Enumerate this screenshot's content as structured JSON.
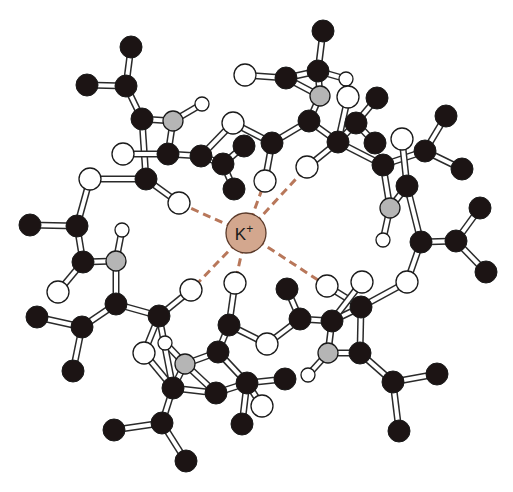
{
  "diagram": {
    "title": "",
    "ion": {
      "label": "K",
      "charge": "+",
      "x": 246,
      "y": 233,
      "r": 20,
      "fill": "#d3a78e",
      "stroke": "#5a3a2a"
    },
    "colors": {
      "carbon": "#1c1414",
      "oxygen": "#ffffff",
      "nitrogen": "#b5b5b5",
      "hydrogen": "#ffffff",
      "bond_fill": "#ffffff",
      "bond_stroke": "#2a2a2a",
      "coordination": "#b8775a"
    },
    "atoms": [
      {
        "id": "c1",
        "el": "C",
        "x": 131,
        "y": 47
      },
      {
        "id": "c2",
        "el": "C",
        "x": 126,
        "y": 86
      },
      {
        "id": "c3",
        "el": "C",
        "x": 87,
        "y": 85
      },
      {
        "id": "c4",
        "el": "C",
        "x": 142,
        "y": 119
      },
      {
        "id": "n1",
        "el": "N",
        "x": 173,
        "y": 121
      },
      {
        "id": "h1",
        "el": "H",
        "x": 202,
        "y": 104
      },
      {
        "id": "o1",
        "el": "O",
        "x": 123,
        "y": 154
      },
      {
        "id": "c5",
        "el": "C",
        "x": 168,
        "y": 154
      },
      {
        "id": "c6",
        "el": "C",
        "x": 201,
        "y": 156
      },
      {
        "id": "c7",
        "el": "C",
        "x": 244,
        "y": 146
      },
      {
        "id": "c8",
        "el": "C",
        "x": 223,
        "y": 164
      },
      {
        "id": "c9",
        "el": "C",
        "x": 234,
        "y": 189
      },
      {
        "id": "o2",
        "el": "O",
        "x": 233,
        "y": 123
      },
      {
        "id": "o3",
        "el": "O",
        "x": 90,
        "y": 179
      },
      {
        "id": "c10",
        "el": "C",
        "x": 146,
        "y": 179
      },
      {
        "id": "o4",
        "el": "O",
        "x": 179,
        "y": 203
      },
      {
        "id": "c11",
        "el": "C",
        "x": 77,
        "y": 226
      },
      {
        "id": "c12",
        "el": "C",
        "x": 30,
        "y": 225
      },
      {
        "id": "h2",
        "el": "H",
        "x": 122,
        "y": 230
      },
      {
        "id": "o5",
        "el": "O",
        "x": 245,
        "y": 75
      },
      {
        "id": "c13",
        "el": "C",
        "x": 323,
        "y": 31
      },
      {
        "id": "c14",
        "el": "C",
        "x": 318,
        "y": 71
      },
      {
        "id": "c15",
        "el": "C",
        "x": 286,
        "y": 78
      },
      {
        "id": "n2",
        "el": "N",
        "x": 320,
        "y": 96
      },
      {
        "id": "h3",
        "el": "H",
        "x": 346,
        "y": 79
      },
      {
        "id": "o6",
        "el": "O",
        "x": 348,
        "y": 97
      },
      {
        "id": "c16",
        "el": "C",
        "x": 309,
        "y": 121
      },
      {
        "id": "c17",
        "el": "C",
        "x": 272,
        "y": 143
      },
      {
        "id": "o7",
        "el": "O",
        "x": 265,
        "y": 181
      },
      {
        "id": "c18",
        "el": "C",
        "x": 377,
        "y": 98
      },
      {
        "id": "c19",
        "el": "C",
        "x": 356,
        "y": 123
      },
      {
        "id": "c20",
        "el": "C",
        "x": 375,
        "y": 143
      },
      {
        "id": "c21",
        "el": "C",
        "x": 338,
        "y": 142
      },
      {
        "id": "o8",
        "el": "O",
        "x": 307,
        "y": 167
      },
      {
        "id": "c22",
        "el": "C",
        "x": 383,
        "y": 165
      },
      {
        "id": "o9",
        "el": "O",
        "x": 402,
        "y": 139
      },
      {
        "id": "c23",
        "el": "C",
        "x": 425,
        "y": 151
      },
      {
        "id": "c24",
        "el": "C",
        "x": 446,
        "y": 116
      },
      {
        "id": "c25",
        "el": "C",
        "x": 462,
        "y": 169
      },
      {
        "id": "c26",
        "el": "C",
        "x": 407,
        "y": 186
      },
      {
        "id": "n3",
        "el": "N",
        "x": 390,
        "y": 208
      },
      {
        "id": "h4",
        "el": "H",
        "x": 383,
        "y": 240
      },
      {
        "id": "c27",
        "el": "C",
        "x": 421,
        "y": 242
      },
      {
        "id": "c28",
        "el": "C",
        "x": 456,
        "y": 241
      },
      {
        "id": "c29",
        "el": "C",
        "x": 480,
        "y": 208
      },
      {
        "id": "c30",
        "el": "C",
        "x": 486,
        "y": 272
      },
      {
        "id": "o10",
        "el": "O",
        "x": 407,
        "y": 282
      },
      {
        "id": "o11",
        "el": "O",
        "x": 327,
        "y": 286
      },
      {
        "id": "o12",
        "el": "O",
        "x": 362,
        "y": 282
      },
      {
        "id": "c31",
        "el": "C",
        "x": 361,
        "y": 307
      },
      {
        "id": "c32",
        "el": "C",
        "x": 332,
        "y": 321
      },
      {
        "id": "c33",
        "el": "C",
        "x": 300,
        "y": 319
      },
      {
        "id": "c34",
        "el": "C",
        "x": 287,
        "y": 289
      },
      {
        "id": "o13",
        "el": "O",
        "x": 267,
        "y": 344
      },
      {
        "id": "n4",
        "el": "N",
        "x": 328,
        "y": 353
      },
      {
        "id": "h5",
        "el": "H",
        "x": 308,
        "y": 375
      },
      {
        "id": "c35",
        "el": "C",
        "x": 360,
        "y": 353
      },
      {
        "id": "c36",
        "el": "C",
        "x": 393,
        "y": 382
      },
      {
        "id": "c37",
        "el": "C",
        "x": 437,
        "y": 374
      },
      {
        "id": "c38",
        "el": "C",
        "x": 399,
        "y": 431
      },
      {
        "id": "c39",
        "el": "C",
        "x": 83,
        "y": 262
      },
      {
        "id": "n5",
        "el": "N",
        "x": 116,
        "y": 261
      },
      {
        "id": "o14",
        "el": "O",
        "x": 58,
        "y": 292
      },
      {
        "id": "c40",
        "el": "C",
        "x": 116,
        "y": 304
      },
      {
        "id": "c41",
        "el": "C",
        "x": 82,
        "y": 327
      },
      {
        "id": "c42",
        "el": "C",
        "x": 37,
        "y": 317
      },
      {
        "id": "c43",
        "el": "C",
        "x": 73,
        "y": 371
      },
      {
        "id": "c44",
        "el": "C",
        "x": 159,
        "y": 316
      },
      {
        "id": "o15",
        "el": "O",
        "x": 191,
        "y": 290
      },
      {
        "id": "o16",
        "el": "O",
        "x": 235,
        "y": 283
      },
      {
        "id": "o17",
        "el": "O",
        "x": 144,
        "y": 353
      },
      {
        "id": "h6",
        "el": "H",
        "x": 165,
        "y": 343
      },
      {
        "id": "n6",
        "el": "N",
        "x": 185,
        "y": 364
      },
      {
        "id": "c45",
        "el": "C",
        "x": 229,
        "y": 325
      },
      {
        "id": "c46",
        "el": "C",
        "x": 218,
        "y": 352
      },
      {
        "id": "c47",
        "el": "C",
        "x": 173,
        "y": 388
      },
      {
        "id": "c48",
        "el": "C",
        "x": 216,
        "y": 393
      },
      {
        "id": "c49",
        "el": "C",
        "x": 247,
        "y": 383
      },
      {
        "id": "c50",
        "el": "C",
        "x": 242,
        "y": 424
      },
      {
        "id": "o18",
        "el": "O",
        "x": 262,
        "y": 406
      },
      {
        "id": "c51",
        "el": "C",
        "x": 162,
        "y": 423
      },
      {
        "id": "c52",
        "el": "C",
        "x": 114,
        "y": 430
      },
      {
        "id": "c53",
        "el": "C",
        "x": 186,
        "y": 461
      },
      {
        "id": "c54",
        "el": "C",
        "x": 285,
        "y": 379
      }
    ],
    "bonds": [
      [
        "c1",
        "c2"
      ],
      [
        "c2",
        "c3"
      ],
      [
        "c2",
        "c4"
      ],
      [
        "c4",
        "n1"
      ],
      [
        "n1",
        "h1"
      ],
      [
        "n1",
        "c5"
      ],
      [
        "c4",
        "c10"
      ],
      [
        "o1",
        "c5"
      ],
      [
        "c5",
        "c6"
      ],
      [
        "c6",
        "o2"
      ],
      [
        "c6",
        "c8"
      ],
      [
        "c8",
        "c7"
      ],
      [
        "c8",
        "c9"
      ],
      [
        "o2",
        "c17"
      ],
      [
        "c10",
        "o3"
      ],
      [
        "c10",
        "o4"
      ],
      [
        "o3",
        "c11"
      ],
      [
        "c11",
        "c12"
      ],
      [
        "c11",
        "c39"
      ],
      [
        "c39",
        "n5"
      ],
      [
        "n5",
        "h2"
      ],
      [
        "c39",
        "o14"
      ],
      [
        "n5",
        "c40"
      ],
      [
        "c40",
        "c41"
      ],
      [
        "c41",
        "c42"
      ],
      [
        "c41",
        "c43"
      ],
      [
        "c40",
        "c44"
      ],
      [
        "c44",
        "o15"
      ],
      [
        "c44",
        "o17"
      ],
      [
        "o5",
        "c15"
      ],
      [
        "c15",
        "c14"
      ],
      [
        "c14",
        "c13"
      ],
      [
        "c14",
        "n2"
      ],
      [
        "c15",
        "n2"
      ],
      [
        "n2",
        "c16"
      ],
      [
        "c14",
        "h3"
      ],
      [
        "h3",
        "o6"
      ],
      [
        "c16",
        "c17"
      ],
      [
        "c17",
        "o7"
      ],
      [
        "c16",
        "c21"
      ],
      [
        "c21",
        "c19"
      ],
      [
        "c19",
        "c18"
      ],
      [
        "c19",
        "c20"
      ],
      [
        "c21",
        "o8"
      ],
      [
        "c21",
        "c22"
      ],
      [
        "o6",
        "c21"
      ],
      [
        "c22",
        "c23"
      ],
      [
        "c23",
        "c24"
      ],
      [
        "c23",
        "c25"
      ],
      [
        "c22",
        "n3"
      ],
      [
        "n3",
        "h4"
      ],
      [
        "o9",
        "c26"
      ],
      [
        "n3",
        "c26"
      ],
      [
        "c26",
        "c27"
      ],
      [
        "c27",
        "c28"
      ],
      [
        "c28",
        "c29"
      ],
      [
        "c28",
        "c30"
      ],
      [
        "c27",
        "o10"
      ],
      [
        "o10",
        "c31"
      ],
      [
        "c31",
        "o11"
      ],
      [
        "c31",
        "c32"
      ],
      [
        "c32",
        "o12"
      ],
      [
        "c32",
        "n4"
      ],
      [
        "c31",
        "c35"
      ],
      [
        "n4",
        "c35"
      ],
      [
        "n4",
        "h5"
      ],
      [
        "c35",
        "c36"
      ],
      [
        "c36",
        "c37"
      ],
      [
        "c36",
        "c38"
      ],
      [
        "c33",
        "c32"
      ],
      [
        "c33",
        "c34"
      ],
      [
        "c33",
        "o13"
      ],
      [
        "o13",
        "c45"
      ],
      [
        "c45",
        "o16"
      ],
      [
        "c45",
        "c46"
      ],
      [
        "c46",
        "n6"
      ],
      [
        "n6",
        "h6"
      ],
      [
        "n6",
        "c47"
      ],
      [
        "c46",
        "c49"
      ],
      [
        "c49",
        "c54"
      ],
      [
        "c49",
        "c50"
      ],
      [
        "c49",
        "o18"
      ],
      [
        "c48",
        "c47"
      ],
      [
        "c48",
        "c49"
      ],
      [
        "c48",
        "n6"
      ],
      [
        "c47",
        "c51"
      ],
      [
        "c51",
        "c52"
      ],
      [
        "c51",
        "c53"
      ],
      [
        "c44",
        "c47"
      ],
      [
        "o17",
        "c47"
      ]
    ],
    "coordination": [
      "o4",
      "o7",
      "o8",
      "o11",
      "o15",
      "o16"
    ]
  }
}
